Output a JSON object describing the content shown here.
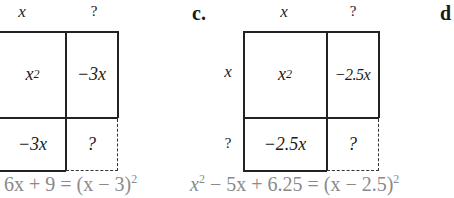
{
  "parts": [
    {
      "label": "",
      "top_labels": [
        "x",
        "?"
      ],
      "side_labels": [],
      "cells": {
        "top_left": "x",
        "top_left_exp": "2",
        "top_right": "−3x",
        "bottom_left": "−3x",
        "bottom_right": "?"
      },
      "equation_lhs": "6x + 9 = (x − 3)",
      "equation_exp": "2"
    },
    {
      "label": "c.",
      "top_labels": [
        "x",
        "?"
      ],
      "side_labels": [
        "x",
        "?"
      ],
      "cells": {
        "top_left": "x",
        "top_left_exp": "2",
        "top_right": "−2.5x",
        "bottom_left": "−2.5x",
        "bottom_right": "?"
      },
      "equation_x": "x",
      "equation_x_exp": "2",
      "equation_rest": " − 5x + 6.25 = (x − 2.5)",
      "equation_exp": "2"
    },
    {
      "label": "d"
    }
  ]
}
